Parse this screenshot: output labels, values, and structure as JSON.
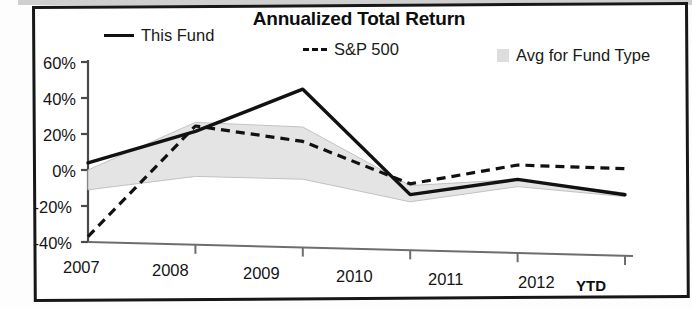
{
  "frame": {
    "name": "scanned-page-border"
  },
  "title": "Annualized Total Return",
  "legend": [
    {
      "key": "this-fund",
      "label": "This Fund",
      "marker": "solid-line",
      "color": "#111111"
    },
    {
      "key": "sp500",
      "label": "S&P 500",
      "marker": "dashed-line",
      "color": "#111111"
    },
    {
      "key": "avg-fund-type",
      "label": "Avg for Fund Type",
      "marker": "gray-swatch",
      "color": "#dddddd"
    }
  ],
  "axis": {
    "y_ticks": [
      "60%",
      "40%",
      "20%",
      "0%",
      "-20%",
      "-40%"
    ],
    "x_ticks": [
      "2007",
      "2008",
      "2009",
      "2010",
      "2011",
      "2012"
    ],
    "ytd_label": "YTD"
  },
  "chart_data": {
    "type": "line",
    "title": "Annualized Total Return",
    "xlabel": "",
    "ylabel": "",
    "categories": [
      "2007",
      "2008",
      "2009",
      "2010",
      "2011",
      "2012 YTD"
    ],
    "ylim": [
      -40,
      60
    ],
    "ytick_values": [
      60,
      40,
      20,
      0,
      -20,
      -40
    ],
    "grid": false,
    "legend_position": "top",
    "series": [
      {
        "name": "This Fund",
        "style": "solid",
        "color": "#111111",
        "values": [
          4,
          23,
          48,
          -9,
          1,
          -6
        ]
      },
      {
        "name": "S&P 500",
        "style": "dashed",
        "color": "#111111",
        "values": [
          -37,
          26,
          19,
          -3,
          9,
          8.5
        ]
      },
      {
        "name": "Avg for Fund Type",
        "style": "band",
        "color": "#dddddd",
        "band_upper": [
          0,
          28,
          27,
          -4,
          1,
          -5
        ],
        "band_lower": [
          -11,
          -2,
          -2,
          -13,
          -3,
          -7
        ]
      }
    ]
  }
}
